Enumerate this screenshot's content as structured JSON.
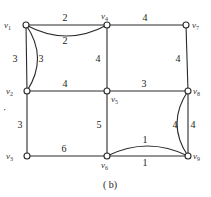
{
  "caption": "( b)",
  "vertices": [
    {
      "id": "v1",
      "name": "v",
      "sub": "1",
      "x": 26,
      "y": 25,
      "lx": 4,
      "ly": 28
    },
    {
      "id": "v2",
      "name": "v",
      "sub": "2",
      "x": 27,
      "y": 91,
      "lx": 6,
      "ly": 94
    },
    {
      "id": "v3",
      "name": "v",
      "sub": "3",
      "x": 27,
      "y": 156,
      "lx": 6,
      "ly": 159
    },
    {
      "id": "v4",
      "name": "v",
      "sub": "4",
      "x": 107,
      "y": 25,
      "lx": 101,
      "ly": 19
    },
    {
      "id": "v5",
      "name": "v",
      "sub": "5",
      "x": 107,
      "y": 91,
      "lx": 111,
      "ly": 102
    },
    {
      "id": "v6",
      "name": "v",
      "sub": "6",
      "x": 107,
      "y": 156,
      "lx": 101,
      "ly": 168
    },
    {
      "id": "v7",
      "name": "v",
      "sub": "7",
      "x": 186,
      "y": 25,
      "lx": 192,
      "ly": 28
    },
    {
      "id": "v8",
      "name": "v",
      "sub": "8",
      "x": 188,
      "y": 91,
      "lx": 193,
      "ly": 94
    },
    {
      "id": "v9",
      "name": "v",
      "sub": "9",
      "x": 188,
      "y": 156,
      "lx": 193,
      "ly": 159
    }
  ],
  "edges": [
    {
      "from": "v1",
      "to": "v4",
      "weight": "2",
      "curve": 0,
      "wx": 65,
      "wy": 21
    },
    {
      "from": "v1",
      "to": "v4",
      "weight": "2",
      "curve": 11,
      "wx": 65,
      "wy": 44
    },
    {
      "from": "v4",
      "to": "v7",
      "weight": "4",
      "curve": 0,
      "wx": 145,
      "wy": 21
    },
    {
      "from": "v1",
      "to": "v2",
      "weight": "3",
      "curve": 0,
      "wx": 15,
      "wy": 62
    },
    {
      "from": "v1",
      "to": "v2",
      "weight": "3",
      "curve": -11,
      "wx": 41,
      "wy": 62
    },
    {
      "from": "v4",
      "to": "v5",
      "weight": "4",
      "curve": 0,
      "wx": 98,
      "wy": 62
    },
    {
      "from": "v7",
      "to": "v8",
      "weight": "4",
      "curve": 0,
      "wx": 178,
      "wy": 62
    },
    {
      "from": "v2",
      "to": "v5",
      "weight": "4",
      "curve": 0,
      "wx": 65,
      "wy": 87
    },
    {
      "from": "v5",
      "to": "v8",
      "weight": "3",
      "curve": 0,
      "wx": 144,
      "wy": 87
    },
    {
      "from": "v2",
      "to": "v3",
      "weight": "3",
      "curve": 0,
      "wx": 20,
      "wy": 128
    },
    {
      "from": "v5",
      "to": "v6",
      "weight": "5",
      "curve": 0,
      "wx": 99,
      "wy": 128
    },
    {
      "from": "v8",
      "to": "v9",
      "weight": "4",
      "curve": 0,
      "wx": 193,
      "wy": 128
    },
    {
      "from": "v8",
      "to": "v9",
      "weight": "4",
      "curve": 11,
      "wx": 175,
      "wy": 128
    },
    {
      "from": "v3",
      "to": "v6",
      "weight": "6",
      "curve": 0,
      "wx": 64,
      "wy": 152
    },
    {
      "from": "v6",
      "to": "v9",
      "weight": "1",
      "curve": -10,
      "wx": 145,
      "wy": 143
    },
    {
      "from": "v6",
      "to": "v9",
      "weight": "1",
      "curve": 0,
      "wx": 145,
      "wy": 166
    }
  ],
  "stray_mark": {
    "x": 3,
    "y": 113,
    "text": "·"
  }
}
